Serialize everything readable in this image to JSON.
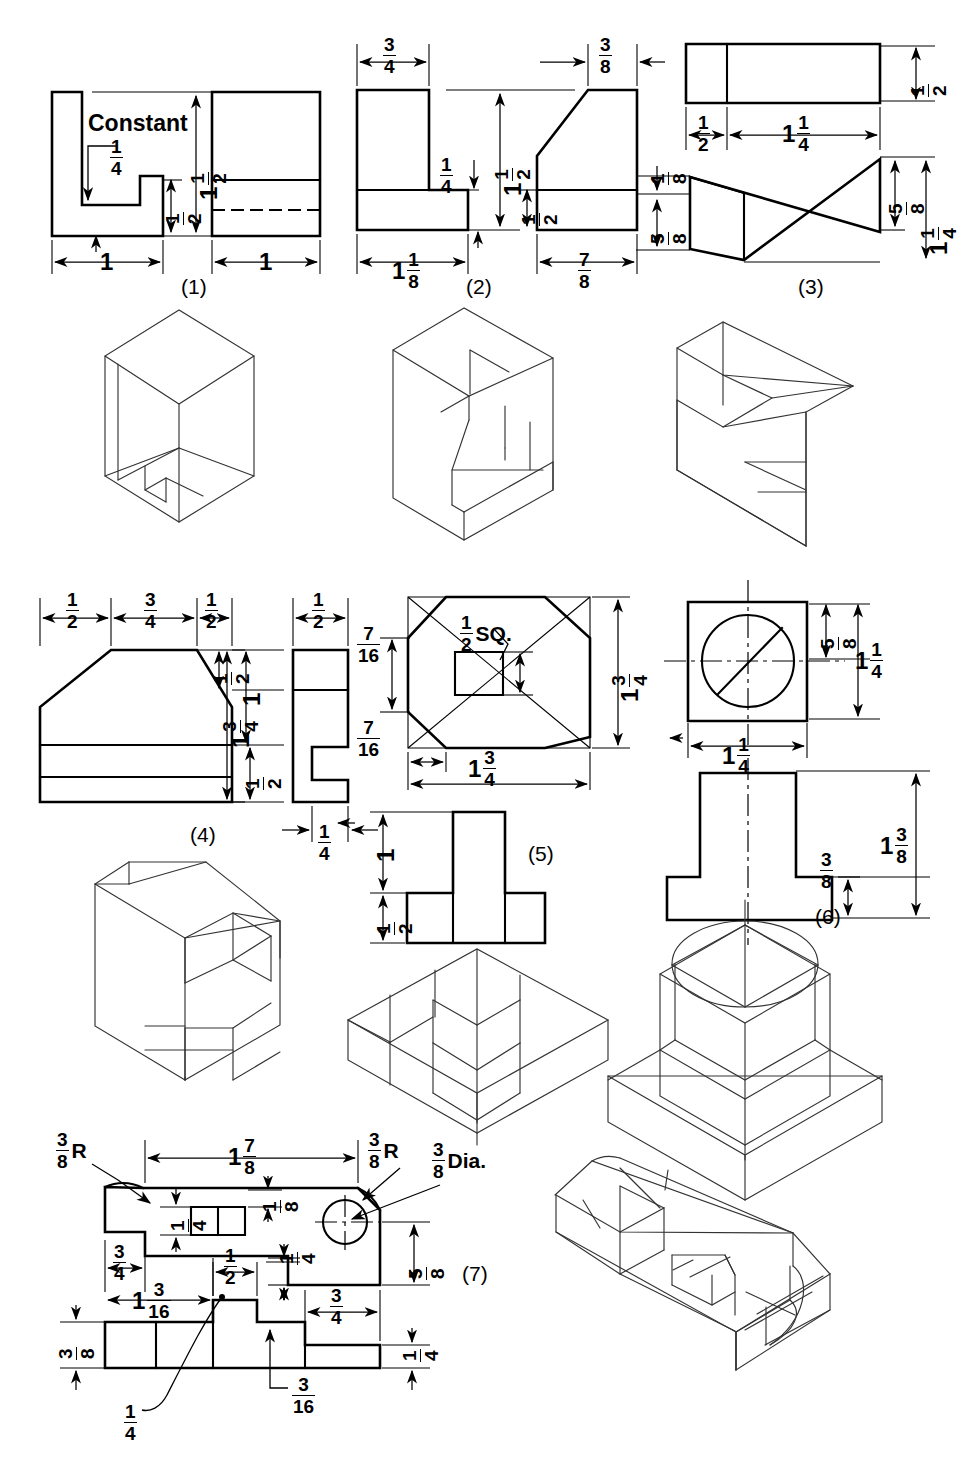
{
  "sheet": {
    "title": "Orthographic and isometric drawing exercises",
    "faint_header": "",
    "ink_color": "#000000",
    "paper_color": "#ffffff"
  },
  "problems": [
    {
      "id": "1",
      "caption": "(1)",
      "note": "Constant",
      "dimensions": [
        {
          "text": "1/4",
          "whole": "",
          "num": "1",
          "den": "4",
          "suffix": ""
        },
        {
          "text": "1 1/2",
          "whole": "1",
          "num": "1",
          "den": "2",
          "suffix": ""
        },
        {
          "text": "1/2",
          "whole": "",
          "num": "1",
          "den": "2",
          "suffix": ""
        },
        {
          "text": "1",
          "whole": "1",
          "num": "",
          "den": "",
          "suffix": ""
        },
        {
          "text": "1",
          "whole": "1",
          "num": "",
          "den": "",
          "suffix": ""
        }
      ]
    },
    {
      "id": "2",
      "caption": "(2)",
      "dimensions": [
        {
          "text": "3/4",
          "whole": "",
          "num": "3",
          "den": "4",
          "suffix": ""
        },
        {
          "text": "3/8",
          "whole": "",
          "num": "3",
          "den": "8",
          "suffix": ""
        },
        {
          "text": "1 1/2",
          "whole": "1",
          "num": "1",
          "den": "2",
          "suffix": ""
        },
        {
          "text": "1/4",
          "whole": "",
          "num": "1",
          "den": "4",
          "suffix": ""
        },
        {
          "text": "1/2",
          "whole": "",
          "num": "1",
          "den": "2",
          "suffix": ""
        },
        {
          "text": "1 1/8",
          "whole": "1",
          "num": "1",
          "den": "8",
          "suffix": ""
        },
        {
          "text": "7/8",
          "whole": "",
          "num": "7",
          "den": "8",
          "suffix": ""
        }
      ]
    },
    {
      "id": "3",
      "caption": "(3)",
      "dimensions": [
        {
          "text": "1/2",
          "whole": "",
          "num": "1",
          "den": "2",
          "suffix": ""
        },
        {
          "text": "1/2",
          "whole": "",
          "num": "1",
          "den": "2",
          "suffix": ""
        },
        {
          "text": "1 1/4",
          "whole": "1",
          "num": "1",
          "den": "4",
          "suffix": ""
        },
        {
          "text": "1/8",
          "whole": "",
          "num": "1",
          "den": "8",
          "suffix": ""
        },
        {
          "text": "5/8",
          "whole": "",
          "num": "5",
          "den": "8",
          "suffix": ""
        },
        {
          "text": "5/8",
          "whole": "",
          "num": "5",
          "den": "8",
          "suffix": ""
        },
        {
          "text": "1 1/4",
          "whole": "1",
          "num": "1",
          "den": "4",
          "suffix": ""
        }
      ]
    },
    {
      "id": "4",
      "caption": "(4)",
      "dimensions": [
        {
          "text": "1/2",
          "whole": "",
          "num": "1",
          "den": "2",
          "suffix": ""
        },
        {
          "text": "3/4",
          "whole": "",
          "num": "3",
          "den": "4",
          "suffix": ""
        },
        {
          "text": "1/2",
          "whole": "",
          "num": "1",
          "den": "2",
          "suffix": ""
        },
        {
          "text": "1/2",
          "whole": "",
          "num": "1",
          "den": "2",
          "suffix": ""
        },
        {
          "text": "1/2",
          "whole": "",
          "num": "1",
          "den": "2",
          "suffix": ""
        },
        {
          "text": "1",
          "whole": "1",
          "num": "",
          "den": "",
          "suffix": ""
        },
        {
          "text": "1 3/4",
          "whole": "1",
          "num": "3",
          "den": "4",
          "suffix": ""
        },
        {
          "text": "1/2",
          "whole": "",
          "num": "1",
          "den": "2",
          "suffix": ""
        },
        {
          "text": "1/4",
          "whole": "",
          "num": "1",
          "den": "4",
          "suffix": ""
        }
      ]
    },
    {
      "id": "5",
      "caption": "(5)",
      "note": "SQ.",
      "dimensions": [
        {
          "text": "1/2 SQ.",
          "whole": "",
          "num": "1",
          "den": "2",
          "suffix": "SQ."
        },
        {
          "text": "1 3/4",
          "whole": "1",
          "num": "3",
          "den": "4",
          "suffix": ""
        },
        {
          "text": "7/16",
          "whole": "",
          "num": "7",
          "den": "16",
          "suffix": ""
        },
        {
          "text": "7/16",
          "whole": "",
          "num": "7",
          "den": "16",
          "suffix": ""
        },
        {
          "text": "1 3/4",
          "whole": "1",
          "num": "3",
          "den": "4",
          "suffix": ""
        },
        {
          "text": "1",
          "whole": "1",
          "num": "",
          "den": "",
          "suffix": ""
        },
        {
          "text": "1/2",
          "whole": "",
          "num": "1",
          "den": "2",
          "suffix": ""
        }
      ]
    },
    {
      "id": "6",
      "caption": "(6)",
      "dimensions": [
        {
          "text": "5/8",
          "whole": "",
          "num": "5",
          "den": "8",
          "suffix": ""
        },
        {
          "text": "1 1/4",
          "whole": "1",
          "num": "1",
          "den": "4",
          "suffix": ""
        },
        {
          "text": "1 1/4",
          "whole": "1",
          "num": "1",
          "den": "4",
          "suffix": ""
        },
        {
          "text": "1 3/8",
          "whole": "1",
          "num": "3",
          "den": "8",
          "suffix": ""
        },
        {
          "text": "3/8",
          "whole": "",
          "num": "3",
          "den": "8",
          "suffix": ""
        }
      ]
    },
    {
      "id": "7",
      "caption": "(7)",
      "dimensions": [
        {
          "text": "3/8 R",
          "whole": "",
          "num": "3",
          "den": "8",
          "suffix": "R"
        },
        {
          "text": "1 7/8",
          "whole": "1",
          "num": "7",
          "den": "8",
          "suffix": ""
        },
        {
          "text": "3/8 R",
          "whole": "",
          "num": "3",
          "den": "8",
          "suffix": "R"
        },
        {
          "text": "3/8 Dia.",
          "whole": "",
          "num": "3",
          "den": "8",
          "suffix": "Dia."
        },
        {
          "text": "1/4",
          "whole": "",
          "num": "1",
          "den": "4",
          "suffix": ""
        },
        {
          "text": "1/8",
          "whole": "",
          "num": "1",
          "den": "8",
          "suffix": ""
        },
        {
          "text": "5/8",
          "whole": "",
          "num": "5",
          "den": "8",
          "suffix": ""
        },
        {
          "text": "3/4",
          "whole": "",
          "num": "3",
          "den": "4",
          "suffix": ""
        },
        {
          "text": "1/2",
          "whole": "",
          "num": "1",
          "den": "2",
          "suffix": ""
        },
        {
          "text": "1/4",
          "whole": "",
          "num": "1",
          "den": "4",
          "suffix": ""
        },
        {
          "text": "1 3/16",
          "whole": "1",
          "num": "3",
          "den": "16",
          "suffix": ""
        },
        {
          "text": "3/4",
          "whole": "",
          "num": "3",
          "den": "4",
          "suffix": ""
        },
        {
          "text": "3/8",
          "whole": "",
          "num": "3",
          "den": "8",
          "suffix": ""
        },
        {
          "text": "1/4",
          "whole": "",
          "num": "1",
          "den": "4",
          "suffix": ""
        },
        {
          "text": "3/16",
          "whole": "",
          "num": "3",
          "den": "16",
          "suffix": ""
        },
        {
          "text": "1/4",
          "whole": "",
          "num": "1",
          "den": "4",
          "suffix": ""
        }
      ]
    }
  ]
}
